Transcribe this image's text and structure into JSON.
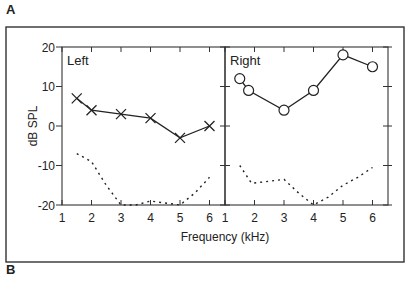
{
  "figure": {
    "panel_labels": [
      "A",
      "B"
    ],
    "xlabel": "Frequency (kHz)",
    "ylabel": "dB SPL"
  },
  "chart_data": [
    {
      "type": "line",
      "title": "Left",
      "xlabel": "Frequency (kHz)",
      "ylabel": "dB SPL",
      "xlim": [
        1,
        6.5
      ],
      "ylim": [
        -20,
        20
      ],
      "xticks": [
        1,
        2,
        3,
        4,
        5,
        6
      ],
      "yticks": [
        -20,
        -10,
        0,
        10,
        20
      ],
      "grid": false,
      "series": [
        {
          "name": "thresholds",
          "marker": "x",
          "style": "solid",
          "x": [
            1.5,
            2,
            3,
            4,
            5,
            6
          ],
          "y": [
            7,
            4,
            3,
            2,
            -3,
            0
          ]
        },
        {
          "name": "noise floor",
          "marker": "none",
          "style": "dotted",
          "x": [
            1.5,
            2,
            2.5,
            3,
            3.5,
            4,
            4.5,
            5,
            5.5,
            6
          ],
          "y": [
            -7,
            -9,
            -15,
            -20,
            -20,
            -19,
            -19.5,
            -20,
            -17,
            -13
          ]
        }
      ]
    },
    {
      "type": "line",
      "title": "Right",
      "xlabel": "Frequency (kHz)",
      "ylabel": "dB SPL",
      "xlim": [
        1,
        6.5
      ],
      "ylim": [
        -20,
        20
      ],
      "xticks": [
        1,
        2,
        3,
        4,
        5,
        6
      ],
      "yticks": [
        -20,
        -10,
        0,
        10,
        20
      ],
      "grid": false,
      "series": [
        {
          "name": "thresholds",
          "marker": "o",
          "style": "solid",
          "x": [
            1.5,
            1.8,
            3,
            4,
            5,
            6
          ],
          "y": [
            12,
            9,
            4,
            9,
            18,
            15
          ]
        },
        {
          "name": "noise floor",
          "marker": "none",
          "style": "dotted",
          "x": [
            1.5,
            1.9,
            2.5,
            3,
            3.5,
            4,
            4.5,
            5,
            5.5,
            6
          ],
          "y": [
            -10,
            -14.5,
            -14,
            -13.5,
            -17,
            -20,
            -18,
            -15,
            -13,
            -10.5
          ]
        }
      ]
    }
  ]
}
